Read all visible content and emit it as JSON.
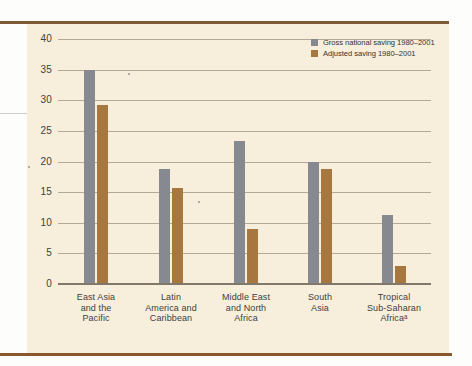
{
  "page": {
    "background_color": "#fdfdfb",
    "paper_color": "#f7eedb",
    "top_rule_color": "#7d5a35",
    "bottom_rule_color": "#8a572e"
  },
  "chart_data": {
    "type": "bar",
    "title": "",
    "xlabel": "",
    "ylabel": "",
    "categories": [
      "East Asia and the Pacific",
      "Latin America and Caribbean",
      "Middle East and North Africa",
      "South Asia",
      "Tropical Sub-Saharan Africaᵃ"
    ],
    "categories_lines": [
      [
        "East Asia",
        "and the",
        "Pacific"
      ],
      [
        "Latin",
        "America and",
        "Caribbean"
      ],
      [
        "Middle East",
        "and North",
        "Africa"
      ],
      [
        "South",
        "Asia"
      ],
      [
        "Tropical",
        "Sub-Saharan",
        "Africaᵃ"
      ]
    ],
    "series": [
      {
        "name": "Gross national saving 1980–2001",
        "color": "#868990",
        "values": [
          35.0,
          18.7,
          23.4,
          20.0,
          11.2
        ]
      },
      {
        "name": "Adjusted saving 1980–2001",
        "color": "#a67840",
        "values": [
          29.3,
          15.6,
          9.0,
          18.8,
          3.0
        ]
      }
    ],
    "ylim": [
      0,
      40
    ],
    "yticks": [
      0,
      5,
      10,
      15,
      20,
      25,
      30,
      35,
      40
    ],
    "grid": true,
    "legend_position": "top-right",
    "gridline_color": "#9c927f",
    "axis_color": "#80786a",
    "text_color": "#3f3f41"
  }
}
